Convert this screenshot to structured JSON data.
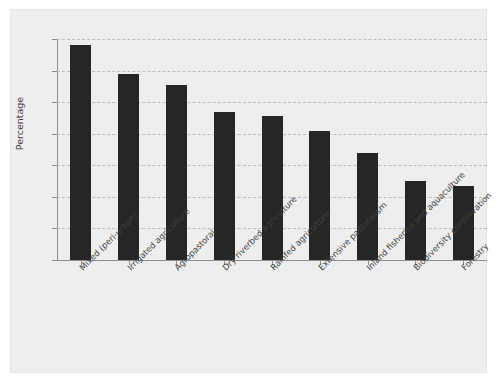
{
  "chart_data": {
    "type": "bar",
    "title": "",
    "xlabel": "",
    "ylabel": "Percentage",
    "ylim": [
      0,
      7
    ],
    "yticks": [
      "0",
      "1",
      "2",
      "3",
      "4",
      "5",
      "6",
      "7"
    ],
    "grid": true,
    "legend": null,
    "bar_color": "#262626",
    "panel_color": "#eeeeee",
    "categories": [
      "Mixed (peri-urban)",
      "Irrigated agriculture",
      "Agropastoral",
      "Dry riverbed agriculture",
      "Rainfed agriculture",
      "Extensive pastoralism",
      "Inland fisheries and aquaculture",
      "Biodiversity conservation",
      "Forestry"
    ],
    "values": [
      6.8,
      5.9,
      5.55,
      4.7,
      4.55,
      4.1,
      3.4,
      2.5,
      2.33
    ]
  }
}
